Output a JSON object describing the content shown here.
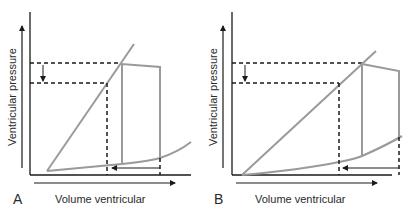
{
  "figure": {
    "panels": [
      {
        "letter": "A",
        "xlabel": "Volume ventricular",
        "ylabel": "Ventricular pressure",
        "description": "Pressure-volume loop with end-systolic pressure-volume relation; decreased end-systolic pressure with leftward shift of volume"
      },
      {
        "letter": "B",
        "xlabel": "Volume ventricular",
        "ylabel": "Ventricular pressure",
        "description": "Pressure-volume loop with reduced ESPVR slope; decreased pressure and larger leftward volume shift"
      }
    ],
    "colors": {
      "curve": "#9a9a9a",
      "axis": "#1a1a1a",
      "dashed": "#1a1a1a",
      "background": "#ffffff"
    }
  }
}
